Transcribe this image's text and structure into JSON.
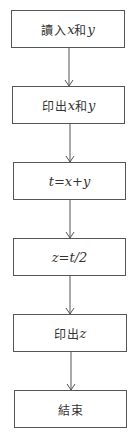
{
  "flowchart": {
    "nodes": [
      {
        "id": "read",
        "parts": [
          {
            "t": "讀入",
            "k": "cjk"
          },
          {
            "t": "x",
            "k": "math"
          },
          {
            "t": "和",
            "k": "cjk"
          },
          {
            "t": "y",
            "k": "math"
          }
        ]
      },
      {
        "id": "print-xy",
        "parts": [
          {
            "t": "印出",
            "k": "cjk"
          },
          {
            "t": "x",
            "k": "math"
          },
          {
            "t": "和",
            "k": "cjk"
          },
          {
            "t": "y",
            "k": "math"
          }
        ]
      },
      {
        "id": "assign-t",
        "parts": [
          {
            "t": "t=x+y",
            "k": "math"
          }
        ]
      },
      {
        "id": "assign-z",
        "parts": [
          {
            "t": "z=t/2",
            "k": "math"
          }
        ]
      },
      {
        "id": "print-z",
        "parts": [
          {
            "t": "印出",
            "k": "cjk"
          },
          {
            "t": "z",
            "k": "math"
          }
        ]
      },
      {
        "id": "end",
        "parts": [
          {
            "t": "結束",
            "k": "cjk"
          }
        ]
      }
    ],
    "edges": [
      {
        "from": "read",
        "to": "print-xy"
      },
      {
        "from": "print-xy",
        "to": "assign-t"
      },
      {
        "from": "assign-t",
        "to": "assign-z"
      },
      {
        "from": "assign-z",
        "to": "print-z"
      },
      {
        "from": "print-z",
        "to": "end"
      }
    ],
    "colors": {
      "line": "#555555",
      "text": "#333333",
      "background": "#ffffff"
    }
  }
}
